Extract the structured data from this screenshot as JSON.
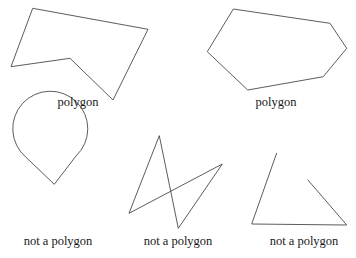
{
  "figure": {
    "background_color": "#ffffff",
    "stroke_color": "#4a4a4a",
    "stroke_width": 0.9,
    "text_color": "#181818",
    "width": 356,
    "height": 258
  },
  "items": [
    {
      "id": "shape-1",
      "name": "concave-heptagon",
      "caption": "polygon",
      "classification": "polygon",
      "closed": true,
      "shape_type": "polyline",
      "points": "32.7,8.3 148,29.3 113,100 70,58.3 11,66.7"
    },
    {
      "id": "shape-2",
      "name": "convex-hexagon",
      "caption": "polygon",
      "classification": "polygon",
      "closed": true,
      "shape_type": "polyline",
      "points": "233.3,9 330,23.3 346.7,48.3 323.3,76.7 247.7,90 207.3,51.7"
    },
    {
      "id": "shape-3",
      "name": "circle-with-notch",
      "caption": "not a polygon",
      "classification": "not a polygon",
      "closed": true,
      "shape_type": "arc-and-vee",
      "circle": {
        "cx": 54.5,
        "cy": 193.5,
        "r": 37.5
      },
      "notch_apex": "54.3,184.3",
      "notch_left": "26,157.3",
      "notch_right": "76,156",
      "path": "M 26,157.3 L 54.3,184.3 L 76,156 A 37.5,37.5 0 1 0 26,157.3 Z"
    },
    {
      "id": "shape-4",
      "name": "self-intersecting-quadrilateral",
      "caption": "not a polygon",
      "classification": "not a polygon",
      "closed": true,
      "shape_type": "polyline",
      "points": "159.3,135.7 178.3,228.3 222.3,164 129,213.3"
    },
    {
      "id": "shape-5",
      "name": "open-triangle",
      "caption": "not a polygon",
      "classification": "not a polygon",
      "closed": false,
      "shape_type": "polyline",
      "points": "276.7,153 251.7,224 346.7,225 307.7,179.7"
    }
  ],
  "captions": {
    "polygon": "polygon",
    "not_a_polygon": "not a polygon"
  }
}
